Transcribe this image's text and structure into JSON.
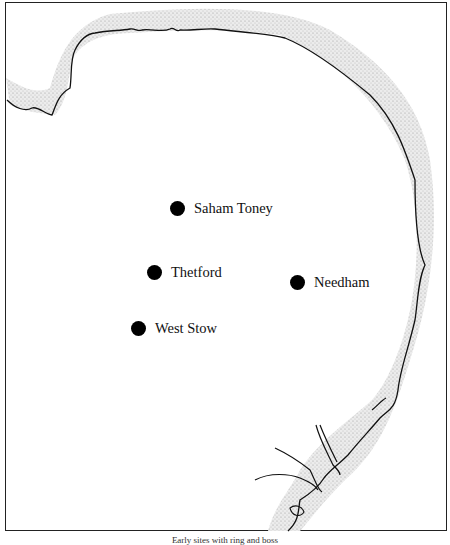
{
  "map": {
    "title": "Map of East Anglia showing sites",
    "sites": [
      {
        "name": "Saham Toney",
        "x": 177,
        "y": 208
      },
      {
        "name": "Thetford",
        "x": 155,
        "y": 272
      },
      {
        "name": "Needham",
        "x": 298,
        "y": 282
      },
      {
        "name": "West Stow",
        "x": 139,
        "y": 328
      }
    ],
    "colors": {
      "coast_line": "#111111",
      "sea_stipple": "#cfcfcf",
      "site_marker": "#000000"
    }
  },
  "caption": "Early sites with ring and boss"
}
